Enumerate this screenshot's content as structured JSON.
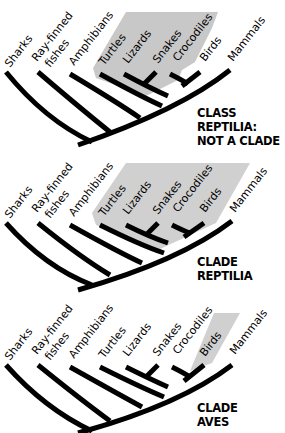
{
  "figure": {
    "type": "cladogram-comparison",
    "taxa": [
      "Sharks",
      "Ray-finned fishes",
      "Amphibians",
      "Turtles",
      "Lizards",
      "Snakes",
      "Crocodiles",
      "Birds",
      "Mammals"
    ],
    "shade_color": "#c8c8c8"
  },
  "panels": [
    {
      "caption_line1": "CLASS REPTILIA:",
      "caption_line2": "NOT A CLADE",
      "highlighted": [
        "Turtles",
        "Lizards",
        "Snakes",
        "Crocodiles"
      ]
    },
    {
      "caption_line1": "CLADE",
      "caption_line2": "REPTILIA",
      "highlighted": [
        "Turtles",
        "Lizards",
        "Snakes",
        "Crocodiles",
        "Birds"
      ]
    },
    {
      "caption_line1": "CLADE",
      "caption_line2": "AVES",
      "highlighted": [
        "Birds"
      ]
    }
  ],
  "labels": {
    "sharks": "Sharks",
    "ray1": "Ray-finned",
    "ray2": "fishes",
    "amphibians": "Amphibians",
    "turtles": "Turtles",
    "lizards": "Lizards",
    "snakes": "Snakes",
    "crocodiles": "Crocodiles",
    "birds": "Birds",
    "mammals": "Mammals"
  }
}
